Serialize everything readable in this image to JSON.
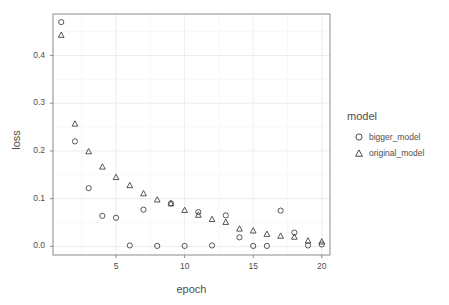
{
  "chart_data": {
    "type": "scatter",
    "title": "",
    "xlabel": "epoch",
    "ylabel": "loss",
    "xlim": [
      0.4,
      20.6
    ],
    "ylim": [
      -0.018,
      0.487
    ],
    "xticks": [
      5,
      10,
      15,
      20
    ],
    "xtick_labels": [
      "5",
      "10",
      "15",
      "20"
    ],
    "yticks": [
      0.0,
      0.1,
      0.2,
      0.3,
      0.4
    ],
    "ytick_labels": [
      "0.0",
      "0.1",
      "0.2",
      "0.3",
      "0.4"
    ],
    "grid": true,
    "legend": {
      "title": "model",
      "position": "right",
      "entries": [
        {
          "name": "bigger_model",
          "marker": "circle"
        },
        {
          "name": "original_model",
          "marker": "triangle"
        }
      ]
    },
    "x": [
      1,
      2,
      3,
      4,
      5,
      6,
      7,
      8,
      9,
      10,
      11,
      12,
      13,
      14,
      15,
      16,
      17,
      18,
      19,
      20
    ],
    "series": [
      {
        "name": "bigger_model",
        "marker": "circle",
        "values": [
          0.47,
          0.22,
          0.122,
          0.064,
          0.06,
          0.002,
          0.077,
          0.001,
          0.09,
          0.001,
          0.072,
          0.002,
          0.065,
          0.019,
          0.001,
          0.001,
          0.075,
          0.029,
          0.002,
          0.004
        ]
      },
      {
        "name": "original_model",
        "marker": "triangle",
        "values": [
          0.444,
          0.258,
          0.2,
          0.168,
          0.146,
          0.129,
          0.112,
          0.099,
          0.091,
          0.077,
          0.067,
          0.058,
          0.052,
          0.038,
          0.034,
          0.027,
          0.023,
          0.021,
          0.013,
          0.011
        ]
      }
    ]
  },
  "colors": {
    "marker": "#3a3a3a",
    "panel_background": "#ffffff",
    "panel_border": "#7f7f7f",
    "gridline_major": "#ededed",
    "gridline_minor": "#f6f6f6",
    "text": "#4d4d4d"
  },
  "axes": {
    "x_title": "epoch",
    "y_title": "loss"
  }
}
